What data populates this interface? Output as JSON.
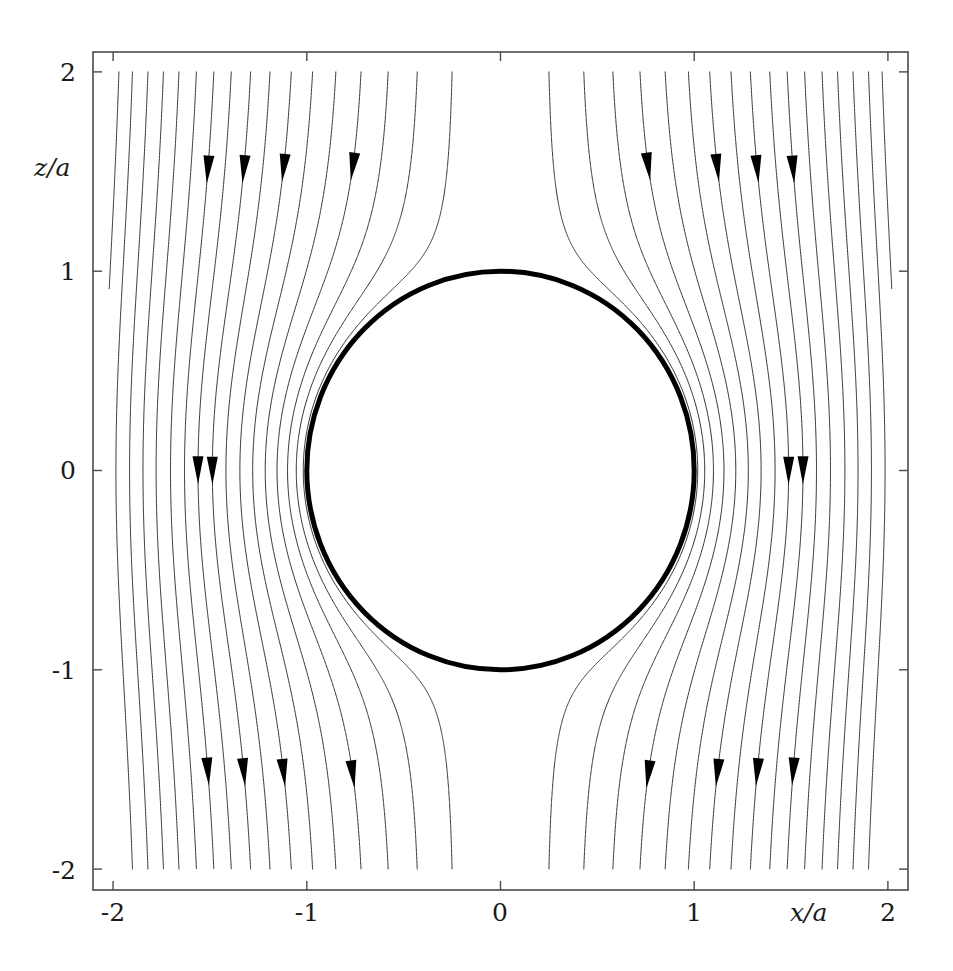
{
  "figure": {
    "kind": "streamline-plot",
    "background_color": "#ffffff",
    "line_color": "#333333",
    "body_color": "#000000"
  },
  "axes": {
    "x_title": "x/a",
    "z_title": "z/a",
    "x_ticks": [
      "-2",
      "-1",
      "0",
      "1",
      "2"
    ],
    "z_ticks": [
      "2",
      "1",
      "0",
      "-1",
      "-2"
    ],
    "frame_color": "#4a4a4a"
  },
  "chart_data": {
    "type": "line",
    "title": "",
    "subtitle": "",
    "xlabel": "x/a",
    "ylabel": "z/a",
    "xlim": [
      -2,
      2
    ],
    "ylim": [
      -2,
      2
    ],
    "grid": false,
    "legend": null,
    "xticks": [
      -2,
      -1,
      0,
      1,
      2
    ],
    "yticks": [
      -2,
      -1,
      0,
      1,
      2
    ],
    "xticklabels": [
      "-2",
      "-1",
      "0",
      "1",
      "2"
    ],
    "yticklabels": [
      "-2",
      "-1",
      "0",
      "1",
      "2"
    ],
    "body": {
      "shape": "circle",
      "center": [
        0,
        0
      ],
      "radius": 1,
      "stroke_width_px": 5,
      "filled": false
    },
    "flow": {
      "model": "potential-flow-past-sphere",
      "stream_function": "psi = 0.5 * U * r^2 * sin(theta)^2 * (1 - a^3 / r^3)",
      "free_stream_speed": 1,
      "direction": "negative-z",
      "sphere_radius": 1
    },
    "streamlines": {
      "count": 34,
      "symmetric_about_x": true,
      "seed_axis": "z = 2 (top edge)",
      "seed_x_values": [
        -1.97,
        -1.9,
        -1.82,
        -1.74,
        -1.66,
        -1.57,
        -1.48,
        -1.39,
        -1.29,
        -1.19,
        -1.08,
        -0.97,
        -0.85,
        -0.72,
        -0.58,
        -0.43,
        -0.25,
        0.25,
        0.43,
        0.58,
        0.72,
        0.85,
        0.97,
        1.08,
        1.19,
        1.29,
        1.39,
        1.48,
        1.57,
        1.66,
        1.74,
        1.82,
        1.9,
        1.97
      ],
      "line_width_px": 1
    },
    "arrows": {
      "count": 16,
      "glyph": "solid-triangle",
      "direction": "down",
      "rows_z": [
        1.5,
        0.0,
        -1.5
      ],
      "positions": [
        {
          "x": -1.48,
          "z": 1.5
        },
        {
          "x": -1.29,
          "z": 1.5
        },
        {
          "x": -1.08,
          "z": 1.5
        },
        {
          "x": -0.72,
          "z": 1.5
        },
        {
          "x": 0.72,
          "z": 1.5
        },
        {
          "x": 1.08,
          "z": 1.5
        },
        {
          "x": 1.29,
          "z": 1.5
        },
        {
          "x": 1.48,
          "z": 1.5
        },
        {
          "x": -1.57,
          "z": 0.0
        },
        {
          "x": -1.48,
          "z": 0.0
        },
        {
          "x": 1.48,
          "z": 0.0
        },
        {
          "x": 1.57,
          "z": 0.0
        },
        {
          "x": -1.48,
          "z": -1.5
        },
        {
          "x": -1.29,
          "z": -1.5
        },
        {
          "x": -1.08,
          "z": -1.5
        },
        {
          "x": -0.72,
          "z": -1.5
        },
        {
          "x": 0.72,
          "z": -1.5
        },
        {
          "x": 1.08,
          "z": -1.5
        },
        {
          "x": 1.29,
          "z": -1.5
        },
        {
          "x": 1.48,
          "z": -1.5
        }
      ]
    }
  }
}
